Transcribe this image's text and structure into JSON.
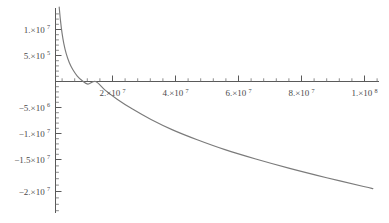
{
  "figure": {
    "background_color": "#ffffff",
    "curve_color": "#7b7b7b",
    "axis_color": "#5a5a5a",
    "label_color": "#4a4a4a"
  },
  "chart_data": {
    "type": "line",
    "title": "",
    "subtitle": "",
    "xlabel": "",
    "ylabel": "",
    "grid": false,
    "legend": null,
    "axes_style": "mathematica-cross-axes",
    "xlim": [
      0,
      105000000
    ],
    "ylim": [
      -23500000,
      14500000
    ],
    "x_axis_position_y": 0,
    "y_axis_position_x": 0,
    "x_tick_labels": [
      "2.×10⁷",
      "4.×10⁷",
      "6.×10⁷",
      "8.×10⁷",
      "1.×10⁸"
    ],
    "x_tick_values": [
      20000000,
      40000000,
      60000000,
      80000000,
      100000000
    ],
    "x_minor_ticks_per_interval": 4,
    "y_tick_labels": [
      "1.×10⁷",
      "5.×10⁵",
      "-5.×10⁶",
      "-1.×10⁷",
      "-1.5×10⁷",
      "-2.×10⁷"
    ],
    "y_tick_values": [
      10000000,
      500000,
      -5000000,
      -10000000,
      -15000000,
      -20000000
    ],
    "y_minor_ticks_per_interval": 4,
    "zero_crossing_x": 13000000,
    "series": [
      {
        "name": "curve",
        "color": "#7b7b7b",
        "x": [
          1200000,
          1600000,
          2100000,
          2700000,
          3500000,
          4500000,
          5600000,
          7000000,
          8600000,
          10500000,
          13000000,
          16000000,
          20000000,
          25000000,
          31000000,
          38000000,
          46000000,
          55000000,
          65000000,
          76000000,
          88000000,
          100000000,
          103000000
        ],
        "y": [
          14300000,
          11800000,
          9400000,
          7300000,
          5300000,
          3600000,
          2300000,
          1100000,
          200000,
          -500000,
          0,
          -1600000,
          -3400000,
          -5300000,
          -7300000,
          -9300000,
          -11200000,
          -13100000,
          -14900000,
          -16700000,
          -18500000,
          -20200000,
          -20600000
        ]
      }
    ],
    "curve_path_description": "Steeply descending hyperbolic/logarithmic-like curve entering the top of the frame near x≈1.3×10⁶, crossing the x-axis near x≈1.3×10⁷, then decreasing gradually to about -2.05×10⁷ at the right edge."
  }
}
